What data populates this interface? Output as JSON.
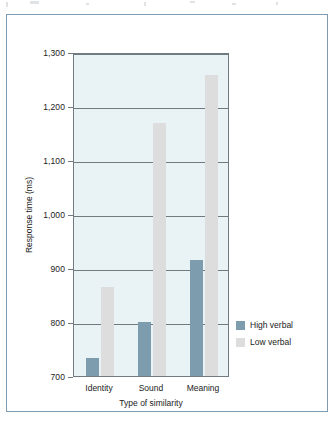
{
  "figure": {
    "border_color": "#7f9cb5",
    "plot_background": "#e9f2f4"
  },
  "chart_data": {
    "type": "bar",
    "title": "",
    "subtitle": "",
    "xlabel": "Type of similarity",
    "ylabel": "Response time (ms)",
    "categories": [
      "Identity",
      "Sound",
      "Meaning"
    ],
    "ylim": [
      700,
      1300
    ],
    "yticks": [
      700,
      800,
      900,
      1000,
      1100,
      1200,
      1300
    ],
    "ytick_labels": [
      "700",
      "800",
      "900",
      "1,000",
      "1,100",
      "1,200",
      "1,300"
    ],
    "grid": true,
    "grid_axis": "y",
    "legend_position": "right",
    "series": [
      {
        "name": "High verbal",
        "color": "#7d9cad",
        "values": [
          733,
          800,
          915
        ]
      },
      {
        "name": "Low verbal",
        "color": "#dddddd",
        "values": [
          865,
          1168,
          1258
        ]
      }
    ]
  },
  "legend": {
    "items": [
      {
        "label": "High verbal",
        "color": "#7d9cad"
      },
      {
        "label": "Low verbal",
        "color": "#dddddd"
      }
    ]
  }
}
